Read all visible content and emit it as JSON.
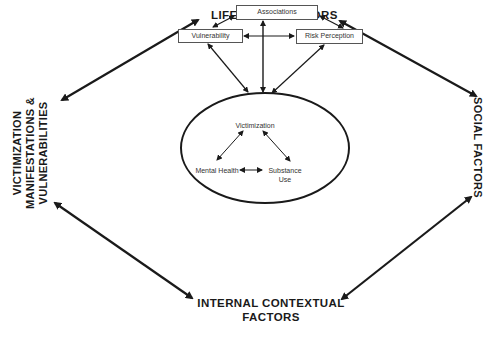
{
  "diagram": {
    "outer_nodes": {
      "top": "LIFESTYLE FACTORS",
      "right": "SOCIAL FACTORS",
      "bottom_line1": "INTERNAL CONTEXTUAL",
      "bottom_line2": "FACTORS",
      "left_line1": "VICTIMIZATION",
      "left_line2": "MANIFESTATIONS &",
      "left_line3": "VULNERABILITIES"
    },
    "lifestyle_boxes": {
      "associations": "Associations",
      "vulnerability": "Vulnerability",
      "risk_perception": "Risk Perception"
    },
    "core": {
      "victimization": "Victimization",
      "mental_health": "Mental Health",
      "substance_use_line1": "Substance",
      "substance_use_line2": "Use"
    },
    "edges": [
      {
        "from": "LIFESTYLE FACTORS",
        "to": "VICTIMIZATION MANIFESTATIONS & VULNERABILITIES",
        "type": "bidirectional"
      },
      {
        "from": "LIFESTYLE FACTORS",
        "to": "SOCIAL FACTORS",
        "type": "bidirectional"
      },
      {
        "from": "VICTIMIZATION MANIFESTATIONS & VULNERABILITIES",
        "to": "INTERNAL CONTEXTUAL FACTORS",
        "type": "bidirectional"
      },
      {
        "from": "SOCIAL FACTORS",
        "to": "INTERNAL CONTEXTUAL FACTORS",
        "type": "bidirectional"
      },
      {
        "from": "Associations",
        "to": "Vulnerability",
        "type": "bidirectional"
      },
      {
        "from": "Associations",
        "to": "Risk Perception",
        "type": "bidirectional"
      },
      {
        "from": "Vulnerability",
        "to": "Risk Perception",
        "type": "bidirectional"
      },
      {
        "from": "Associations",
        "to": "core-ellipse",
        "type": "bidirectional"
      },
      {
        "from": "Vulnerability",
        "to": "core-ellipse",
        "type": "bidirectional"
      },
      {
        "from": "Risk Perception",
        "to": "core-ellipse",
        "type": "bidirectional"
      },
      {
        "from": "Victimization",
        "to": "Mental Health",
        "type": "bidirectional"
      },
      {
        "from": "Victimization",
        "to": "Substance Use",
        "type": "bidirectional"
      },
      {
        "from": "Mental Health",
        "to": "Substance Use",
        "type": "bidirectional"
      }
    ]
  }
}
